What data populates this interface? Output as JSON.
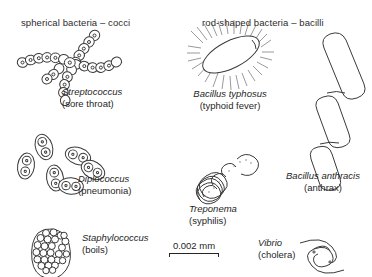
{
  "figure": {
    "title_left": "spherical bacteria – cocci",
    "title_right": "rod-shaped bacteria – bacilli"
  },
  "organisms": [
    {
      "key": "streptococcus",
      "scientific_name": "Streptococcus",
      "common_name": "(sore throat)",
      "group": "cocci",
      "shape": "branching chain of spherical cells",
      "icon": "streptococcus-chain-icon"
    },
    {
      "key": "diplococcus",
      "scientific_name": "Diplococcus",
      "common_name": "(pneumonia)",
      "group": "cocci",
      "shape": "paired spherical cells in capsules",
      "icon": "diplococcus-pairs-icon"
    },
    {
      "key": "staphylococcus",
      "scientific_name": "Staphylococcus",
      "common_name": "(boils)",
      "group": "cocci",
      "shape": "grape-like cluster of spherical cells",
      "icon": "staphylococcus-cluster-icon"
    },
    {
      "key": "bacillus_typhosus",
      "scientific_name": "Bacillus typhosus",
      "common_name": "(typhoid fever)",
      "group": "bacilli",
      "shape": "rod with peritrichous flagella",
      "icon": "bacillus-typhosus-flagella-icon"
    },
    {
      "key": "bacillus_anthracis",
      "scientific_name": "Bacillus anthracis",
      "common_name": "(anthrax)",
      "group": "bacilli",
      "shape": "chain of large rods",
      "icon": "bacillus-anthracis-rods-icon"
    },
    {
      "key": "treponema",
      "scientific_name": "Treponema",
      "common_name": "(syphilis)",
      "group": "spirochete",
      "shape": "coiled spiral filament",
      "icon": "treponema-spiral-icon"
    },
    {
      "key": "vibrio",
      "scientific_name": "Vibrio",
      "common_name": "(cholera)",
      "group": "curved rod",
      "shape": "two comma-shaped curved cells",
      "icon": "vibrio-comma-icon"
    }
  ],
  "scale_bar": {
    "label": "0.002 mm",
    "length_px": 50
  },
  "colors": {
    "ink": "#3a3a3a",
    "text": "#1f1f1f",
    "background": "#ffffff"
  }
}
